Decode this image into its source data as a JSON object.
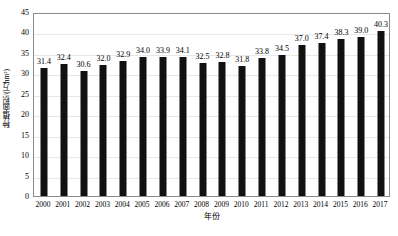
{
  "chart_data": {
    "type": "bar",
    "title": "",
    "xlabel": "年份",
    "ylabel": "种植面积/(万hm²)",
    "categories": [
      "2000",
      "2001",
      "2002",
      "2003",
      "2004",
      "2005",
      "2006",
      "2007",
      "2008",
      "2009",
      "2010",
      "2011",
      "2012",
      "2013",
      "2014",
      "2015",
      "2016",
      "2017"
    ],
    "values": [
      31.4,
      32.4,
      30.6,
      32.0,
      32.9,
      34.0,
      33.9,
      34.1,
      32.5,
      32.8,
      31.8,
      33.8,
      34.5,
      37.0,
      37.4,
      38.3,
      39.0,
      40.3
    ],
    "data_labels": [
      "31.4",
      "32.4",
      "30.6",
      "32.0",
      "32.9",
      "34.0",
      "33.9",
      "34.1",
      "32.5",
      "32.8",
      "31.8",
      "33.8",
      "34.5",
      "37.0",
      "37.4",
      "38.3",
      "39.0",
      "40.3"
    ],
    "ylim": [
      0,
      45
    ],
    "yticks": [
      0,
      5,
      10,
      15,
      20,
      25,
      30,
      35,
      40,
      45
    ],
    "ytick_labels": [
      "0",
      "5",
      "10",
      "15",
      "20",
      "25",
      "30",
      "35",
      "40",
      "45"
    ],
    "grid": true,
    "legend": "none",
    "series_color": "#111111",
    "grid_color": "#e8e8e8",
    "border_color": "#8a8a8a"
  }
}
